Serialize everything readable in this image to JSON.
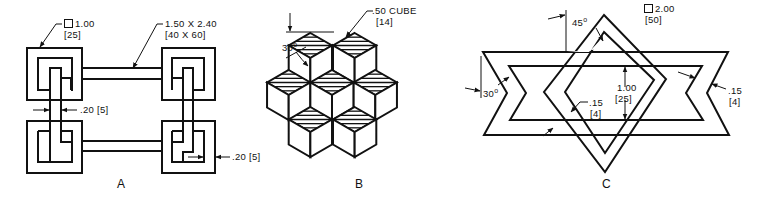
{
  "figures": [
    {
      "caption": "A",
      "annotations": {
        "link_square_in": "1.00",
        "link_square_mm": "[25]",
        "bar_size_in": "1.50 X 2.40",
        "bar_size_mm": "[40 X 60]",
        "stroke_width_a": ".20 [5]",
        "stroke_width_b": ".20 [5]"
      }
    },
    {
      "caption": "B",
      "annotations": {
        "cube_size_in": ".50 CUBE",
        "cube_size_mm": "[14]",
        "angle": "30",
        "degree": "o"
      }
    },
    {
      "caption": "C",
      "annotations": {
        "square_in": "2.00",
        "square_mm": "[50]",
        "angle_top": "45",
        "angle_left": "30",
        "degree": "o",
        "height_in": "1.00",
        "height_mm": "[25]",
        "band_width_center_in": ".15",
        "band_width_center_mm": "[4]",
        "band_width_right_in": ".15",
        "band_width_right_mm": "[4]"
      }
    }
  ],
  "colors": {
    "line": "#111111",
    "background": "#ffffff"
  }
}
